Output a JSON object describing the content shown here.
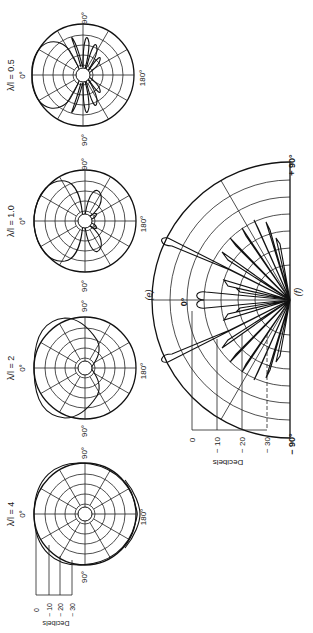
{
  "figure": {
    "panel_e_label": "(e)",
    "panel_f_label": "(f)",
    "plots": [
      {
        "id": "p05",
        "title": "λ/l = 0.5",
        "top_label": "0°",
        "left_label": "90°",
        "right_label": "90°",
        "bottom_label": "180°"
      },
      {
        "id": "p10",
        "title": "λ/l = 1.0",
        "top_label": "0°",
        "left_label": "90°",
        "right_label": "90°",
        "bottom_label": "180°"
      },
      {
        "id": "p2",
        "title": "λ/l = 2",
        "top_label": "0°",
        "left_label": "90°",
        "right_label": "90°",
        "bottom_label": "180°"
      },
      {
        "id": "p4",
        "title": "λ/l = 4",
        "top_label": "0°",
        "left_label": "90°",
        "right_label": "90°",
        "bottom_label": "180°"
      }
    ],
    "small_scale": {
      "axis_label": "Decibels",
      "ticks": [
        "0",
        "− 10",
        "− 20",
        "− 30"
      ]
    },
    "large_plot": {
      "top_label": "0°",
      "left_label": "− 90°",
      "right_label": "+ 90°",
      "axis_label": "Decibels",
      "ticks": [
        "0",
        "− 10",
        "− 20",
        "− 30"
      ]
    }
  }
}
